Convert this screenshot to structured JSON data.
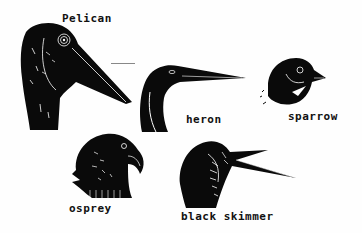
{
  "artwork": {
    "style": "linocut print",
    "ink_color": "#0a0a0a",
    "paper_color": "#fefefe",
    "birds": [
      {
        "name": "pelican",
        "label": "Pelican"
      },
      {
        "name": "heron",
        "label": "heron"
      },
      {
        "name": "sparrow",
        "label": "sparrow"
      },
      {
        "name": "osprey",
        "label": "osprey"
      },
      {
        "name": "black-skimmer",
        "label": "black skimmer"
      }
    ]
  }
}
